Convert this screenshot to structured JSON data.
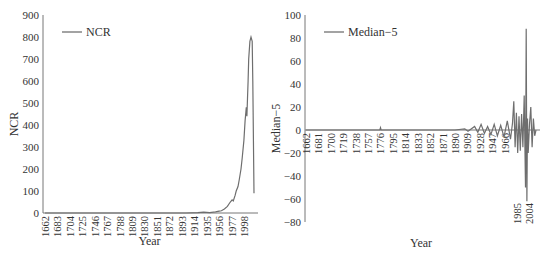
{
  "chart_data": [
    {
      "type": "line",
      "title": "",
      "xlabel": "Year",
      "ylabel": "NCR",
      "ylim": [
        0,
        900
      ],
      "yticks": [
        0,
        100,
        200,
        300,
        400,
        500,
        600,
        700,
        800,
        900
      ],
      "xticks": [
        "1662",
        "1683",
        "1704",
        "1725",
        "1746",
        "1767",
        "1788",
        "1809",
        "1830",
        "1851",
        "1872",
        "1893",
        "1914",
        "1935",
        "1956",
        "1977",
        "1998"
      ],
      "legend": {
        "position": "upper-left",
        "entries": [
          "NCR"
        ]
      },
      "grid": false,
      "series": [
        {
          "name": "NCR",
          "x": [
            1662,
            1900,
            1920,
            1930,
            1940,
            1950,
            1956,
            1960,
            1965,
            1970,
            1975,
            1978,
            1980,
            1983,
            1985,
            1988,
            1990,
            1993,
            1995,
            1998,
            2000,
            2002,
            2003,
            2004,
            2005,
            2006,
            2008,
            2010,
            2012,
            2013,
            2015
          ],
          "values": [
            0,
            0,
            2,
            4,
            2,
            5,
            8,
            10,
            18,
            30,
            50,
            60,
            55,
            80,
            100,
            120,
            150,
            200,
            250,
            330,
            420,
            480,
            440,
            520,
            600,
            700,
            780,
            800,
            780,
            600,
            90
          ]
        }
      ]
    },
    {
      "type": "line",
      "title": "",
      "xlabel": "Year",
      "ylabel": "Median-5",
      "ylim": [
        -80,
        100
      ],
      "yticks": [
        -80,
        -60,
        -40,
        -20,
        0,
        20,
        40,
        60,
        80,
        100
      ],
      "xticks": [
        "1662",
        "1681",
        "1700",
        "1719",
        "1738",
        "1757",
        "1776",
        "1795",
        "1814",
        "1833",
        "1852",
        "1871",
        "1890",
        "1909",
        "1928",
        "1947",
        "1966",
        "1985",
        "2004"
      ],
      "legend": {
        "position": "upper-left",
        "entries": [
          "Median-5"
        ]
      },
      "grid": false,
      "series": [
        {
          "name": "Median-5",
          "x": [
            1662,
            1775,
            1776,
            1777,
            1890,
            1905,
            1910,
            1920,
            1925,
            1930,
            1935,
            1940,
            1945,
            1950,
            1955,
            1960,
            1965,
            1970,
            1975,
            1978,
            1980,
            1982,
            1984,
            1986,
            1988,
            1990,
            1992,
            1994,
            1996,
            1998,
            1999,
            2000,
            2001,
            2002,
            2004,
            2006,
            2008,
            2010,
            2012,
            2014
          ],
          "values": [
            0,
            0,
            2,
            0,
            0,
            1,
            -1,
            3,
            -2,
            5,
            -3,
            3,
            -4,
            5,
            -5,
            4,
            -6,
            8,
            -8,
            6,
            25,
            -15,
            15,
            -20,
            12,
            -18,
            14,
            -15,
            30,
            -50,
            88,
            -62,
            10,
            -20,
            5,
            20,
            -15,
            10,
            -5,
            0
          ]
        }
      ]
    }
  ],
  "left_chart": {
    "legend_label": "NCR",
    "ylabel": "NCR",
    "xlabel": "Year"
  },
  "right_chart": {
    "legend_label": "Median−5",
    "ylabel": "Median−5",
    "xlabel": "Year"
  }
}
